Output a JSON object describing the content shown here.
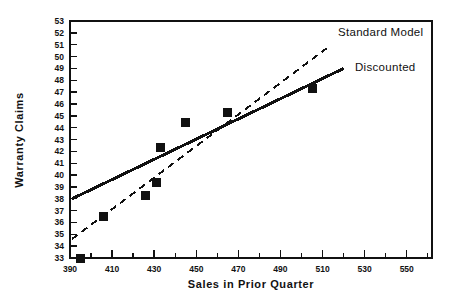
{
  "chart_data": {
    "type": "scatter",
    "title": "",
    "xlabel": "Sales in Prior Quarter",
    "ylabel": "Warranty Claims",
    "xlim": [
      390,
      562
    ],
    "ylim": [
      33,
      53
    ],
    "grid": false,
    "legend_position": "inline-annotation-upper-right",
    "x_major_ticks": [
      390,
      410,
      430,
      450,
      470,
      490,
      510,
      530,
      550
    ],
    "x_tick_labels": [
      "390",
      "410",
      "430",
      "450",
      "470",
      "490",
      "510",
      "530",
      "550"
    ],
    "x_minor_tick_step": 10,
    "y_major_ticks": [
      33,
      34,
      35,
      36,
      37,
      38,
      39,
      40,
      41,
      42,
      43,
      44,
      45,
      46,
      47,
      48,
      49,
      50,
      51,
      52,
      53
    ],
    "y_tick_labels": [
      "33",
      "34",
      "35",
      "36",
      "37",
      "38",
      "39",
      "40",
      "41",
      "42",
      "43",
      "44",
      "45",
      "46",
      "47",
      "48",
      "49",
      "50",
      "51",
      "52",
      "53"
    ],
    "points": [
      {
        "x": 395,
        "y": 33.0
      },
      {
        "x": 406,
        "y": 36.5
      },
      {
        "x": 426,
        "y": 38.3
      },
      {
        "x": 431,
        "y": 39.4
      },
      {
        "x": 433,
        "y": 42.3
      },
      {
        "x": 445,
        "y": 44.4
      },
      {
        "x": 465,
        "y": 45.3
      },
      {
        "x": 505,
        "y": 47.3
      }
    ],
    "marker_style": "filled-square",
    "marker_color": "#111111",
    "series": [
      {
        "name": "Standard Model",
        "style": "dashed",
        "color": "#111111",
        "endpoints": [
          {
            "x": 391,
            "y": 34.6
          },
          {
            "x": 512,
            "y": 50.7
          }
        ]
      },
      {
        "name": "Discounted",
        "style": "solid",
        "color": "#111111",
        "endpoints": [
          {
            "x": 391,
            "y": 38.0
          },
          {
            "x": 520,
            "y": 49.0
          }
        ]
      }
    ],
    "annotations": [
      {
        "label": "Standard Model",
        "x_px": 338,
        "y_px": 36
      },
      {
        "label": "Discounted",
        "x_px": 355,
        "y_px": 71
      }
    ]
  }
}
